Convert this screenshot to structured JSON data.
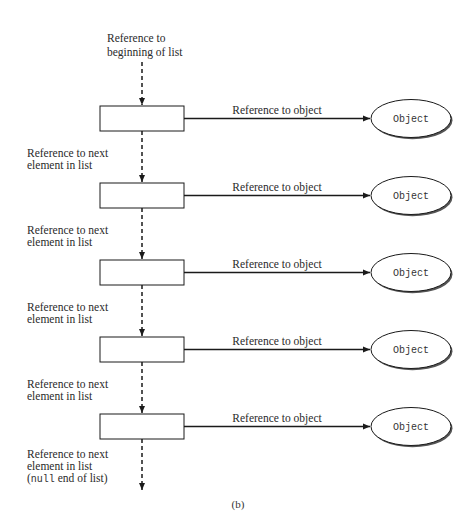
{
  "diagram": {
    "head_label": [
      "Reference to",
      "beginning of list"
    ],
    "next_label": [
      "Reference to next",
      "element in list"
    ],
    "last_label": [
      "Reference to next",
      "element in list"
    ],
    "null_keyword": "null",
    "null_suffix": " end of list)",
    "null_prefix": "(",
    "object_ref_label": "Reference to object",
    "object_label": "Object",
    "node_count": 5,
    "caption": "(b)",
    "colors": {
      "line": "#1a1a1a",
      "shadow": "#555555",
      "text": "#2a2a2a"
    }
  }
}
